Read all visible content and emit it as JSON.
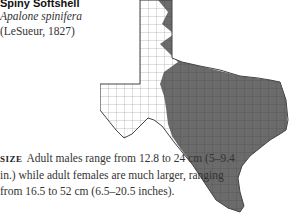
{
  "species": {
    "common_name": "Spiny Softshell",
    "scientific_name": "Apalone spinifera",
    "authority": "(LeSueur, 1827)"
  },
  "size": {
    "label": "SIZE",
    "text": "Adult males range from 12.8 to 24 cm (5–9.4 in.) while adult females are much larger, ranging from 16.5 to 52 cm (6.5–20.5 inches)."
  },
  "map": {
    "region": "Texas",
    "range_color": "#6b6b6b",
    "nonrange_color": "#ffffff",
    "border_color": "#444444"
  }
}
